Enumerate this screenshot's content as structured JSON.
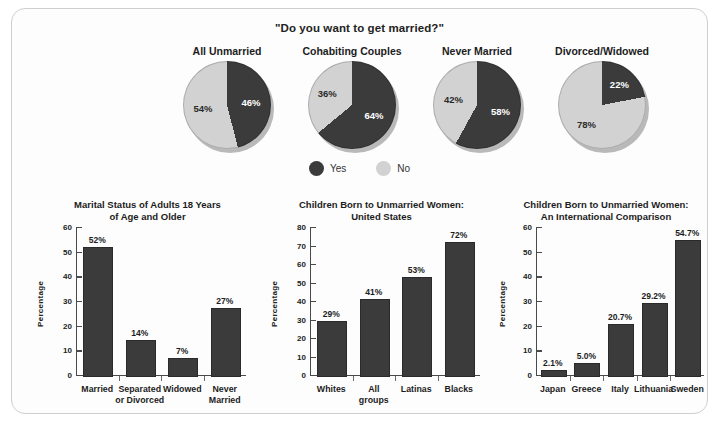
{
  "poll": {
    "title": "\"Do you want to get married?\"",
    "legend": [
      {
        "label": "Yes",
        "color": "#3b3b3b"
      },
      {
        "label": "No",
        "color": "#d2d2d2"
      }
    ],
    "pies": [
      {
        "heading": "All Unmarried",
        "yes": 46,
        "no": 54,
        "yes_label": "46%",
        "no_label": "54%"
      },
      {
        "heading": "Cohabiting Couples",
        "yes": 64,
        "no": 36,
        "yes_label": "64%",
        "no_label": "36%"
      },
      {
        "heading": "Never Married",
        "yes": 58,
        "no": 42,
        "yes_label": "58%",
        "no_label": "42%"
      },
      {
        "heading": "Divorced/Widowed",
        "yes": 22,
        "no": 78,
        "yes_label": "22%",
        "no_label": "78%"
      }
    ]
  },
  "chart_data": [
    {
      "type": "bar",
      "title": "Marital Status of Adults 18 Years\nof Age and Older",
      "title_lines": [
        "Marital Status of Adults 18 Years",
        "of Age and Older"
      ],
      "xlabel": "",
      "ylabel": "Percentage",
      "ylim": [
        0,
        60
      ],
      "yticks": [
        0,
        10,
        20,
        30,
        40,
        50,
        60
      ],
      "grid": false,
      "categories": [
        "Married",
        "Separated\nor Divorced",
        "Widowed",
        "Never\nMarried"
      ],
      "values": [
        52,
        14,
        7,
        27
      ],
      "value_labels": [
        "52%",
        "14%",
        "7%",
        "27%"
      ]
    },
    {
      "type": "bar",
      "title": "Children Born to Unmarried Women:\nUnited States",
      "title_lines": [
        "Children Born to Unmarried Women:",
        "United States"
      ],
      "xlabel": "",
      "ylabel": "Percentage",
      "ylim": [
        0,
        80
      ],
      "yticks": [
        0,
        10,
        20,
        30,
        40,
        50,
        60,
        70,
        80
      ],
      "grid": false,
      "categories": [
        "Whites",
        "All\ngroups",
        "Latinas",
        "Blacks"
      ],
      "values": [
        29,
        41,
        53,
        72
      ],
      "value_labels": [
        "29%",
        "41%",
        "53%",
        "72%"
      ]
    },
    {
      "type": "bar",
      "title": "Children Born to Unmarried Women:\nAn International Comparison",
      "title_lines": [
        "Children Born to Unmarried Women:",
        "An International Comparison"
      ],
      "xlabel": "",
      "ylabel": "Percentage",
      "ylim": [
        0,
        60
      ],
      "yticks": [
        0,
        10,
        20,
        30,
        40,
        50,
        60
      ],
      "grid": false,
      "categories": [
        "Japan",
        "Greece",
        "Italy",
        "Lithuania",
        "Sweden"
      ],
      "values": [
        2.1,
        5.0,
        20.7,
        29.2,
        54.7
      ],
      "value_labels": [
        "2.1%",
        "5.0%",
        "20.7%",
        "29.2%",
        "54.7%"
      ]
    }
  ],
  "colors": {
    "bar_fill": "#3b3b3b",
    "pie_yes": "#3b3b3b",
    "pie_no": "#d2d2d2",
    "axis": "#4a4a4a",
    "frame": "#cfcfcf"
  }
}
